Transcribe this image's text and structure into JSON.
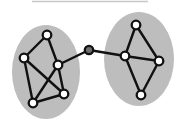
{
  "diagram": {
    "type": "graph",
    "colors": {
      "cluster_fill": "#bdbdbd",
      "edge": "#111111",
      "node_fill": "#ffffff",
      "node_stroke": "#111111",
      "bridge_node_fill": "#6e6e6e",
      "top_rule": "#c8c8c8"
    },
    "top_rule": {
      "x1": 32,
      "x2": 148,
      "y": 1.5
    },
    "clusters": [
      {
        "id": "left",
        "cx": 46,
        "cy": 72,
        "rx": 34,
        "ry": 47
      },
      {
        "id": "right",
        "cx": 139,
        "cy": 59,
        "rx": 35,
        "ry": 47
      }
    ],
    "nodes": [
      {
        "id": "L1",
        "cluster": "left",
        "x": 47,
        "y": 35
      },
      {
        "id": "L2",
        "cluster": "left",
        "x": 24,
        "y": 58
      },
      {
        "id": "L3",
        "cluster": "left",
        "x": 58,
        "y": 65
      },
      {
        "id": "L4",
        "cluster": "left",
        "x": 64,
        "y": 94
      },
      {
        "id": "L5",
        "cluster": "left",
        "x": 33,
        "y": 103
      },
      {
        "id": "B",
        "cluster": "none",
        "x": 89,
        "y": 50,
        "bridge": true
      },
      {
        "id": "R1",
        "cluster": "right",
        "x": 136,
        "y": 25
      },
      {
        "id": "R2",
        "cluster": "right",
        "x": 125,
        "y": 56
      },
      {
        "id": "R3",
        "cluster": "right",
        "x": 159,
        "y": 61
      },
      {
        "id": "R4",
        "cluster": "right",
        "x": 141,
        "y": 95
      }
    ],
    "edges": [
      [
        "L1",
        "L2"
      ],
      [
        "L1",
        "L3"
      ],
      [
        "L2",
        "L4"
      ],
      [
        "L2",
        "L5"
      ],
      [
        "L3",
        "L5"
      ],
      [
        "L3",
        "L4"
      ],
      [
        "L5",
        "L4"
      ],
      [
        "L3",
        "B"
      ],
      [
        "B",
        "R2"
      ],
      [
        "R2",
        "R1"
      ],
      [
        "R1",
        "R3"
      ],
      [
        "R2",
        "R3"
      ],
      [
        "R2",
        "R4"
      ],
      [
        "R3",
        "R4"
      ]
    ]
  }
}
